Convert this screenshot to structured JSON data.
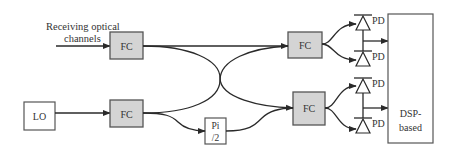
{
  "diagram": {
    "input_label_line1": "Receiving optical",
    "input_label_line2": "channels",
    "blocks": {
      "fc_top_left": "FC",
      "fc_bottom_left": "FC",
      "fc_top_right": "FC",
      "fc_bottom_right": "FC",
      "lo": "LO",
      "phase_shifter_line1": "Pi",
      "phase_shifter_line2": "/2",
      "dsp_line1": "DSP-",
      "dsp_line2": "based"
    },
    "photodiodes": [
      "PD",
      "PD",
      "PD",
      "PD"
    ],
    "colors": {
      "fc_fill": "#d4d4d4",
      "stroke": "#2a2a2a",
      "text": "#333333"
    }
  }
}
